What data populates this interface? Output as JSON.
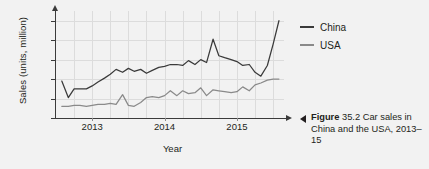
{
  "chart_data": {
    "type": "line",
    "title": "",
    "xlabel": "Year",
    "ylabel": "Sales (units, million)",
    "ylim": [
      14,
      25
    ],
    "xlim": [
      2012.5,
      2015.65
    ],
    "yticks": [
      14,
      16,
      18,
      20,
      22,
      24
    ],
    "xticks": [
      2013,
      2014,
      2015
    ],
    "grid": true,
    "legend_position": "right",
    "series": [
      {
        "name": "China",
        "color": "#3a3a3a",
        "x": [
          2012.58,
          2012.67,
          2012.75,
          2012.83,
          2012.92,
          2013.0,
          2013.08,
          2013.17,
          2013.25,
          2013.33,
          2013.42,
          2013.5,
          2013.58,
          2013.67,
          2013.75,
          2013.83,
          2013.92,
          2014.0,
          2014.08,
          2014.17,
          2014.25,
          2014.33,
          2014.42,
          2014.5,
          2014.58,
          2014.67,
          2014.75,
          2014.83,
          2014.92,
          2015.0,
          2015.08,
          2015.17,
          2015.25,
          2015.33,
          2015.42,
          2015.5,
          2015.58
        ],
        "values": [
          17.8,
          16.1,
          17.0,
          17.0,
          17.0,
          17.3,
          17.7,
          18.1,
          18.5,
          19.0,
          18.7,
          19.1,
          18.8,
          19.0,
          18.6,
          18.9,
          19.2,
          19.3,
          19.5,
          19.5,
          19.4,
          19.9,
          19.5,
          20.0,
          19.7,
          22.1,
          20.4,
          20.2,
          20.0,
          19.8,
          19.4,
          19.5,
          18.7,
          18.3,
          19.4,
          21.6,
          24.0
        ]
      },
      {
        "name": "USA",
        "color": "#8a8a8a",
        "x": [
          2012.58,
          2012.67,
          2012.75,
          2012.83,
          2012.92,
          2013.0,
          2013.08,
          2013.17,
          2013.25,
          2013.33,
          2013.42,
          2013.5,
          2013.58,
          2013.67,
          2013.75,
          2013.83,
          2013.92,
          2014.0,
          2014.08,
          2014.17,
          2014.25,
          2014.33,
          2014.42,
          2014.5,
          2014.58,
          2014.67,
          2014.75,
          2014.83,
          2014.92,
          2015.0,
          2015.08,
          2015.17,
          2015.25,
          2015.33,
          2015.42,
          2015.5,
          2015.58
        ],
        "values": [
          15.2,
          15.2,
          15.3,
          15.3,
          15.2,
          15.3,
          15.4,
          15.4,
          15.5,
          15.4,
          16.4,
          15.3,
          15.2,
          15.6,
          16.1,
          16.2,
          16.1,
          16.3,
          16.8,
          16.3,
          16.8,
          16.5,
          16.6,
          17.1,
          16.3,
          16.9,
          16.8,
          16.7,
          16.6,
          16.7,
          17.2,
          16.8,
          17.4,
          17.6,
          17.9,
          18.0,
          18.0
        ]
      }
    ]
  },
  "legend": {
    "items": [
      {
        "label": "China"
      },
      {
        "label": "USA"
      }
    ]
  },
  "caption": {
    "figure_word": "Figure",
    "text": " 35.2 Car sales in China and the USA, 2013–15"
  },
  "colors": {
    "background": "#f2f2f2",
    "axis": "#3b3b3b",
    "grid": "#dcdcdc",
    "china": "#3a3a3a",
    "usa": "#8a8a8a",
    "text": "#231f20"
  }
}
